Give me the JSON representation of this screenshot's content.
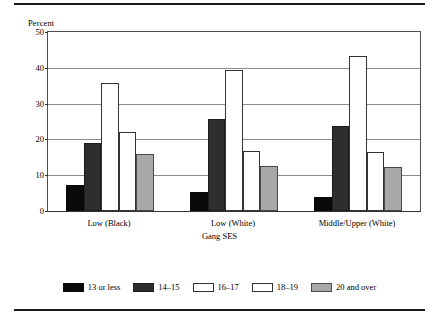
{
  "figure": {
    "top_rule": true,
    "bottom_rule": true
  },
  "chart_data": {
    "type": "bar",
    "title": "",
    "ylabel": "Percent",
    "xlabel": "Gang SES",
    "ylim": [
      0,
      50
    ],
    "yticks": [
      0,
      10,
      20,
      30,
      40,
      50
    ],
    "grid": true,
    "legend_position": "bottom",
    "categories": [
      "Low (Black)",
      "Low (White)",
      "Middle/Upper (White)"
    ],
    "series": [
      {
        "name": "13 or less",
        "color": "#0a0a0a",
        "values": [
          7.3,
          5.3,
          4.0
        ]
      },
      {
        "name": "14–15",
        "color": "#2e2e2e",
        "values": [
          19.1,
          25.8,
          23.7
        ]
      },
      {
        "name": "16–17",
        "color": "#ffffff",
        "values": [
          35.7,
          39.5,
          43.3
        ]
      },
      {
        "name": "18–19",
        "color": "#ffffff",
        "values": [
          22.0,
          16.7,
          16.6
        ]
      },
      {
        "name": "20 and over",
        "color": "#a8a8a8",
        "values": [
          15.8,
          12.7,
          12.4
        ]
      }
    ]
  }
}
